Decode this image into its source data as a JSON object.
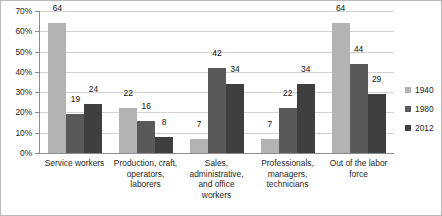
{
  "chart_data": {
    "type": "bar",
    "title": "",
    "subtitle": "",
    "xlabel": "",
    "ylabel": "",
    "ylim": [
      0,
      70
    ],
    "ytick_values": [
      0,
      10,
      20,
      30,
      40,
      50,
      60,
      70
    ],
    "ytick_labels": [
      "0%",
      "10%",
      "20%",
      "30%",
      "40%",
      "50%",
      "60%",
      "70%"
    ],
    "grid": true,
    "legend_position": "right",
    "value_labels": true,
    "categories": [
      "Service workers",
      "Production, craft, operators, laborers",
      "Sales, administrative, and office workers",
      "Professionals, managers, technicians",
      "Out of the labor force"
    ],
    "category_lines": [
      [
        "Service workers"
      ],
      [
        "Production, craft,",
        "operators,",
        "laborers"
      ],
      [
        "Sales,",
        "administrative,",
        "and office",
        "workers"
      ],
      [
        "Professionals,",
        "managers,",
        "technicians"
      ],
      [
        "Out of the labor",
        "force"
      ]
    ],
    "series": [
      {
        "name": "1940",
        "color": "#b3b3b3",
        "values": [
          64,
          22,
          7,
          7,
          64
        ]
      },
      {
        "name": "1980",
        "color": "#595959",
        "values": [
          19,
          16,
          42,
          22,
          44
        ]
      },
      {
        "name": "2012",
        "color": "#3f3f3f",
        "values": [
          24,
          8,
          34,
          34,
          29
        ]
      }
    ]
  },
  "legend": {
    "items": [
      {
        "label": "1940"
      },
      {
        "label": "1980"
      },
      {
        "label": "2012"
      }
    ]
  }
}
